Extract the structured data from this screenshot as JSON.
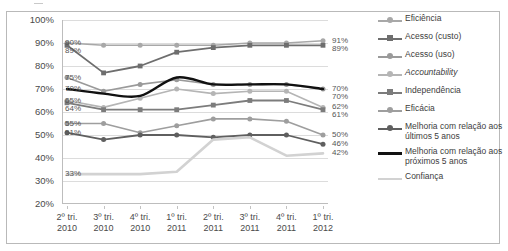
{
  "chart_data": {
    "type": "line",
    "title": "",
    "xlabel": "",
    "ylabel": "",
    "ylim": [
      20,
      100
    ],
    "ytick_labels": [
      "100%",
      "90%",
      "80%",
      "70%",
      "60%",
      "50%",
      "40%",
      "30%",
      "20%"
    ],
    "ytick_values": [
      100,
      90,
      80,
      70,
      60,
      50,
      40,
      30,
      20
    ],
    "grid": true,
    "legend_position": "right",
    "categories": [
      "2º tri. 2010",
      "3º tri. 2010",
      "4º tri. 2010",
      "1º tri. 2011",
      "2º tri. 2011",
      "3º tri. 2011",
      "4º tri. 2011",
      "1º tri. 2012"
    ],
    "category_lines": [
      {
        "top": "2º tri.",
        "bottom": "2010"
      },
      {
        "top": "3º tri.",
        "bottom": "2010"
      },
      {
        "top": "4º tri.",
        "bottom": "2010"
      },
      {
        "top": "1º tri.",
        "bottom": "2011"
      },
      {
        "top": "2º tri.",
        "bottom": "2011"
      },
      {
        "top": "3º tri.",
        "bottom": "2011"
      },
      {
        "top": "4º tri.",
        "bottom": "2011"
      },
      {
        "top": "1º tri.",
        "bottom": "2012"
      }
    ],
    "series": [
      {
        "name": "Eficiência",
        "marker": "circle",
        "color": "#a8a8a8",
        "width": 1.6,
        "values": [
          90,
          89,
          89,
          89,
          89,
          90,
          90,
          91
        ],
        "first_label": "90%",
        "last_label": "91%"
      },
      {
        "name": "Acesso (custo)",
        "marker": "square",
        "color": "#6e6e6e",
        "width": 1.8,
        "values": [
          89,
          77,
          80,
          86,
          88,
          89,
          89,
          89
        ],
        "first_label": "89%",
        "last_label": "89%"
      },
      {
        "name": "Acesso (uso)",
        "marker": "circle",
        "color": "#9a9a9a",
        "width": 1.6,
        "values": [
          75,
          69,
          72,
          74,
          72,
          72,
          72,
          70
        ],
        "first_label": "75%",
        "last_label": "70%"
      },
      {
        "name": "Accountability",
        "marker": "circle",
        "color": "#b5b5b5",
        "width": 1.6,
        "italic": true,
        "values": [
          65,
          62,
          66,
          70,
          68,
          69,
          69,
          62
        ],
        "first_label": "65%",
        "last_label": "62%"
      },
      {
        "name": "Independência",
        "marker": "square",
        "color": "#7c7c7c",
        "width": 1.8,
        "values": [
          64,
          61,
          61,
          61,
          63,
          65,
          65,
          61
        ],
        "first_label": "64%",
        "last_label": "61%"
      },
      {
        "name": "Eficácia",
        "marker": "circle",
        "color": "#9e9e9e",
        "width": 1.6,
        "values": [
          55,
          55,
          51,
          54,
          57,
          57,
          56,
          50
        ],
        "first_label": "55%",
        "last_label": "50%"
      },
      {
        "name": "Melhoria com relação aos últimos 5 anos",
        "marker": "circle",
        "color": "#5f5f5f",
        "width": 1.8,
        "values": [
          51,
          48,
          50,
          50,
          49,
          50,
          50,
          46
        ],
        "first_label": "51%",
        "last_label": "46%"
      },
      {
        "name": "Melhoria com relação aos próximos 5 anos",
        "marker": "none",
        "color": "#111111",
        "width": 2.4,
        "smooth": true,
        "values": [
          70,
          68,
          67,
          75,
          72,
          72,
          72,
          70
        ],
        "first_label": "70%",
        "last_label": "70%"
      },
      {
        "name": "Confiança",
        "marker": "none",
        "color": "#d2d2d2",
        "width": 2.6,
        "values": [
          33,
          33,
          33,
          34,
          48,
          49,
          41,
          42
        ],
        "first_label": "33%",
        "last_label": "42%"
      }
    ],
    "left_labels": [
      "90%",
      "89%",
      "75%",
      "70%",
      "65%",
      "64%",
      "55%",
      "51%",
      "33%"
    ],
    "right_labels": [
      "91%",
      "89%",
      "70%",
      "69%",
      "62%",
      "61%",
      "50%",
      "46%",
      "42%"
    ]
  },
  "legend": {
    "items": [
      {
        "label": "Eficiência",
        "key": "circle",
        "color": "#a8a8a8",
        "italic": false
      },
      {
        "label": "Acesso (custo)",
        "key": "square",
        "color": "#6e6e6e",
        "italic": false
      },
      {
        "label": "Acesso (uso)",
        "key": "circle",
        "color": "#9a9a9a",
        "italic": false
      },
      {
        "label": "Accountability",
        "key": "circle",
        "color": "#b5b5b5",
        "italic": true
      },
      {
        "label": "Independência",
        "key": "square",
        "color": "#7c7c7c",
        "italic": false
      },
      {
        "label": "Eficácia",
        "key": "circle",
        "color": "#9e9e9e",
        "italic": false
      },
      {
        "label": "Melhoria com relação aos últimos 5 anos",
        "key": "circle",
        "color": "#5f5f5f",
        "italic": false
      },
      {
        "label": "Melhoria com relação aos próximos 5 anos",
        "key": "thick",
        "color": "#111111",
        "italic": false
      },
      {
        "label": "Confiança",
        "key": "pale",
        "color": "#d2d2d2",
        "italic": false
      }
    ]
  }
}
